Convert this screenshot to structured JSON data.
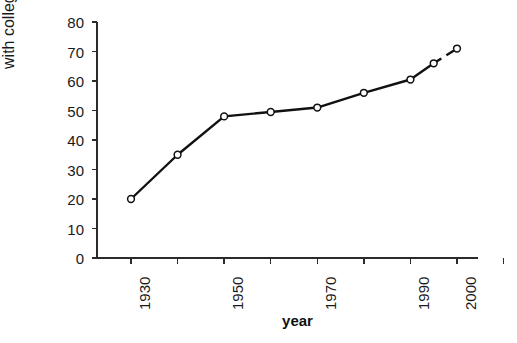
{
  "chart_data": {
    "type": "line",
    "title": "",
    "xlabel": "year",
    "ylabel_line1": "percent population",
    "ylabel_line2": "with college degree",
    "x": [
      1930,
      1940,
      1950,
      1960,
      1970,
      1980,
      1990,
      1995,
      2000
    ],
    "values": [
      20,
      35,
      48,
      49.5,
      51,
      56,
      60.5,
      66,
      71
    ],
    "series": [
      {
        "name": "percent population with college degree",
        "values": [
          20,
          35,
          48,
          49.5,
          51,
          56,
          60.5,
          66,
          71
        ]
      }
    ],
    "dashed_from_index": 7,
    "xlim": [
      1930,
      2010
    ],
    "ylim": [
      0,
      80
    ],
    "xticks": [
      1930,
      1940,
      1950,
      1960,
      1970,
      1980,
      1990,
      2000,
      2010
    ],
    "xtick_labels": [
      "1930",
      "",
      "1950",
      "",
      "1970",
      "",
      "1990",
      "2000",
      ""
    ],
    "yticks": [
      0,
      10,
      20,
      30,
      40,
      50,
      60,
      70,
      80
    ],
    "ytick_labels": [
      "0",
      "10",
      "20",
      "30",
      "40",
      "50",
      "60",
      "70",
      "80"
    ],
    "grid": false,
    "legend": "none",
    "marker": "open-circle",
    "line_color": "#111111",
    "marker_fill": "#ffffff",
    "axis_color": "#2b2b2b"
  }
}
